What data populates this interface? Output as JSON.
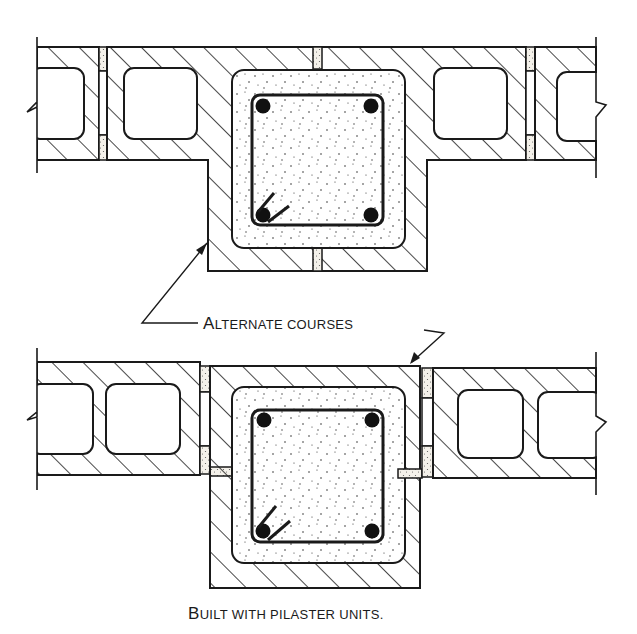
{
  "figure": {
    "type": "masonry-pilaster-section-diagram",
    "views": [
      {
        "name": "top-course",
        "description": "Pilaster unit projecting from wall, head joints at sides, reinforced grouted core"
      },
      {
        "name": "bottom-course",
        "description": "Alternate course with pilaster unit between standard blocks, reinforced grouted core"
      }
    ],
    "labels": {
      "alternate_first": "A",
      "alternate_rest": "LTERNATE COURSES",
      "caption_first": "B",
      "caption_rest": "UILT WITH PILASTER UNITS."
    },
    "colors": {
      "ink": "#1a1a1a",
      "background": "#ffffff",
      "mortar_fill": "#f4f1ea"
    }
  }
}
